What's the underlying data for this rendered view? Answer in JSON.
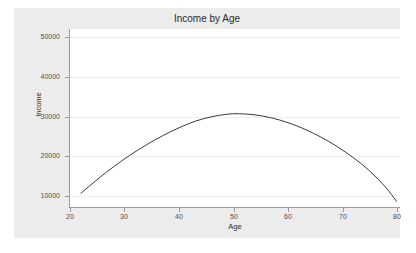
{
  "chart_data": {
    "type": "line",
    "title": "Income by Age",
    "xlabel": "Age",
    "ylabel": "Income",
    "xlim": [
      20,
      80
    ],
    "ylim": [
      5000,
      52000
    ],
    "grid": true,
    "legend": false,
    "xticks": [
      20,
      30,
      40,
      50,
      60,
      70,
      80
    ],
    "xtick_labels": [
      "20",
      "30",
      "40",
      "50",
      "60",
      "70",
      "80"
    ],
    "yticks": [
      10000,
      20000,
      30000,
      40000,
      50000
    ],
    "ytick_labels": [
      "10000",
      "20000",
      "30000",
      "40000",
      "50000"
    ],
    "series": [
      {
        "name": "Income",
        "color": "#3a3a3a",
        "x": [
          22,
          25,
          28,
          31,
          34,
          37,
          40,
          43,
          46,
          49,
          51,
          54,
          57,
          60,
          63,
          66,
          69,
          72,
          75,
          78,
          80
        ],
        "y": [
          10700,
          14200,
          17400,
          20300,
          22900,
          25200,
          27200,
          28900,
          30000,
          30650,
          30750,
          30450,
          29700,
          28500,
          26900,
          24900,
          22500,
          19700,
          16400,
          12200,
          8500
        ]
      }
    ],
    "curve_description": "Concave quadratic peaking near age 50-51 at about 30750",
    "colors": {
      "canvas_background": "#ececec",
      "plot_background": "#ffffff",
      "gridline": "#f0f0f0",
      "axis": "#9a9a9a",
      "curve": "#3a3a3a",
      "tick_label": "#4d4d4d",
      "title_text": "#2b2b2b"
    }
  },
  "ytick_positions_px": [
    196,
    156,
    117,
    77,
    37
  ],
  "xtick_positions_px": [
    70,
    124.5,
    179,
    234,
    288.5,
    343,
    397
  ]
}
